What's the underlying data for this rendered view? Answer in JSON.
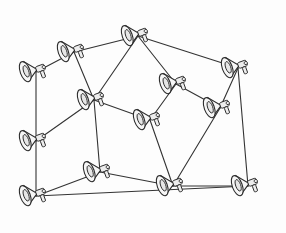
{
  "illustration": {
    "title": "Network of connected megaphones",
    "style": "hand-drawn line art",
    "colors": {
      "line": "#333333",
      "fill": "#f6f6f6",
      "background": "#fdfdfd"
    },
    "nodes": [
      {
        "id": "n1",
        "icon": "megaphone-icon",
        "x": 74,
        "y": 52,
        "angle": -20
      },
      {
        "id": "n2",
        "icon": "megaphone-icon",
        "x": 36,
        "y": 72,
        "angle": -20
      },
      {
        "id": "n3",
        "icon": "megaphone-icon",
        "x": 138,
        "y": 36,
        "angle": -20
      },
      {
        "id": "n4",
        "icon": "megaphone-icon",
        "x": 238,
        "y": 68,
        "angle": -20
      },
      {
        "id": "n5",
        "icon": "megaphone-icon",
        "x": 94,
        "y": 100,
        "angle": -20
      },
      {
        "id": "n6",
        "icon": "megaphone-icon",
        "x": 176,
        "y": 84,
        "angle": -20
      },
      {
        "id": "n7",
        "icon": "megaphone-icon",
        "x": 150,
        "y": 120,
        "angle": -20
      },
      {
        "id": "n8",
        "icon": "megaphone-icon",
        "x": 220,
        "y": 108,
        "angle": -20
      },
      {
        "id": "n9",
        "icon": "megaphone-icon",
        "x": 36,
        "y": 141,
        "angle": -20
      },
      {
        "id": "n10",
        "icon": "megaphone-icon",
        "x": 100,
        "y": 172,
        "angle": -20
      },
      {
        "id": "n11",
        "icon": "megaphone-icon",
        "x": 36,
        "y": 196,
        "angle": -20
      },
      {
        "id": "n12",
        "icon": "megaphone-icon",
        "x": 173,
        "y": 186,
        "angle": -20
      },
      {
        "id": "n13",
        "icon": "megaphone-icon",
        "x": 248,
        "y": 186,
        "angle": -20
      }
    ],
    "edges": [
      [
        "n2",
        "n1"
      ],
      [
        "n1",
        "n3"
      ],
      [
        "n3",
        "n4"
      ],
      [
        "n1",
        "n5"
      ],
      [
        "n3",
        "n6"
      ],
      [
        "n2",
        "n9"
      ],
      [
        "n5",
        "n7"
      ],
      [
        "n5",
        "n9"
      ],
      [
        "n6",
        "n7"
      ],
      [
        "n6",
        "n8"
      ],
      [
        "n4",
        "n8"
      ],
      [
        "n4",
        "n13"
      ],
      [
        "n7",
        "n12"
      ],
      [
        "n9",
        "n11"
      ],
      [
        "n5",
        "n10"
      ],
      [
        "n10",
        "n11"
      ],
      [
        "n10",
        "n12"
      ],
      [
        "n11",
        "n13"
      ],
      [
        "n8",
        "n12"
      ],
      [
        "n12",
        "n13"
      ],
      [
        "n3",
        "n5"
      ]
    ]
  }
}
